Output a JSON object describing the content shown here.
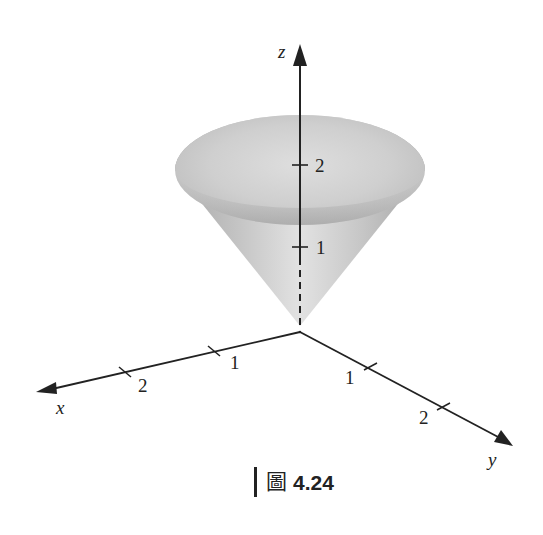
{
  "figure": {
    "type": "3d-cone-surface",
    "axes": {
      "x": {
        "label": "x",
        "ticks": [
          "1",
          "2"
        ]
      },
      "y": {
        "label": "y",
        "ticks": [
          "1",
          "2"
        ]
      },
      "z": {
        "label": "z",
        "ticks": [
          "1",
          "2"
        ]
      }
    },
    "colors": {
      "axis": "#222222",
      "cone_light": "#e6e6e6",
      "cone_mid": "#c8c8c8",
      "cone_dark": "#a6a6a6",
      "background": "#ffffff"
    }
  },
  "caption": {
    "prefix_glyph": "圖",
    "number": "4.24"
  }
}
